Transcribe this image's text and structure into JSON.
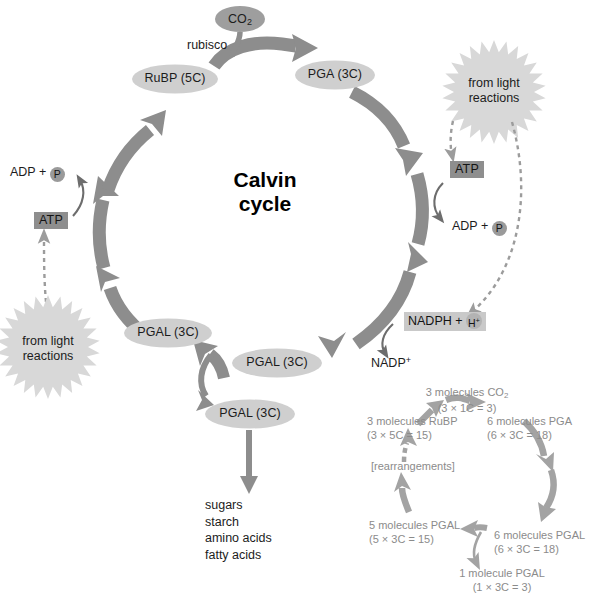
{
  "figure": {
    "center_label_line1": "Calvin",
    "center_label_line2": "cycle"
  },
  "colors": {
    "cycle_arrow": "#8d8d8d",
    "node_fill": "#cfcfcf",
    "co2_fill": "#9e9e9e",
    "burst_fill": "#d8d8d8",
    "thin_arrow": "#6d6d6d",
    "dashed_arrow": "#9c9c9c",
    "summary_arrow": "#a3a3a3",
    "summary_text": "#8b8b8b",
    "atp_badge_bg": "#8e8e8e",
    "nadph_badge_bg": "#c9c9c9",
    "product_arrow": "#8d8d8d"
  },
  "main_cycle": {
    "nodes": [
      {
        "id": "rubp",
        "label": "RuBP (5C)"
      },
      {
        "id": "pga",
        "label": "PGA (3C)"
      },
      {
        "id": "pgal_left",
        "label": "PGAL (3C)"
      },
      {
        "id": "pgal_bottom",
        "label": "PGAL (3C)"
      },
      {
        "id": "pgal_exit",
        "label": "PGAL (3C)"
      }
    ],
    "inputs": {
      "co2_label": "CO2",
      "co2_label_html": "CO<sub>2</sub>",
      "enzyme_label": "rubisco"
    }
  },
  "energy": {
    "left": {
      "adp_label": "ADP + ",
      "p_symbol": "P",
      "atp_label": "ATP",
      "source_line1": "from light",
      "source_line2": "reactions"
    },
    "right": {
      "source_line1": "from light",
      "source_line2": "reactions",
      "atp_label": "ATP",
      "adp_label": "ADP + ",
      "p_symbol": "P",
      "nadph_label": "NADPH + ",
      "h_symbol": "H+",
      "h_symbol_html": "H<sup>+</sup>",
      "nadp_label": "NADP+",
      "nadp_label_html": "NADP<sup>+</sup>"
    }
  },
  "products": {
    "items": [
      "sugars",
      "starch",
      "amino acids",
      "fatty acids"
    ],
    "text_block": "sugars\nstarch\namino acids\nfatty acids"
  },
  "summary_cycle": {
    "co2_line1": "3 molecules CO2",
    "co2_line1_html": "3 molecules CO<sub>2</sub>",
    "co2_line2": "(3 × 1C = 3)",
    "rubp_line1": "3 molecules RuBP",
    "rubp_line2": "(3 × 5C = 15)",
    "pga_line1": "6 molecules PGA",
    "pga_line2": "(6 × 3C = 18)",
    "pgal6_line1": "6 molecules PGAL",
    "pgal6_line2": "(6 × 3C = 18)",
    "pgal5_line1": "5 molecules PGAL",
    "pgal5_line2": "(5 × 3C = 15)",
    "pgal1_line1": "1 molecule PGAL",
    "pgal1_line2": "(1 × 3C = 3)",
    "rearrangements": "[rearrangements]"
  }
}
